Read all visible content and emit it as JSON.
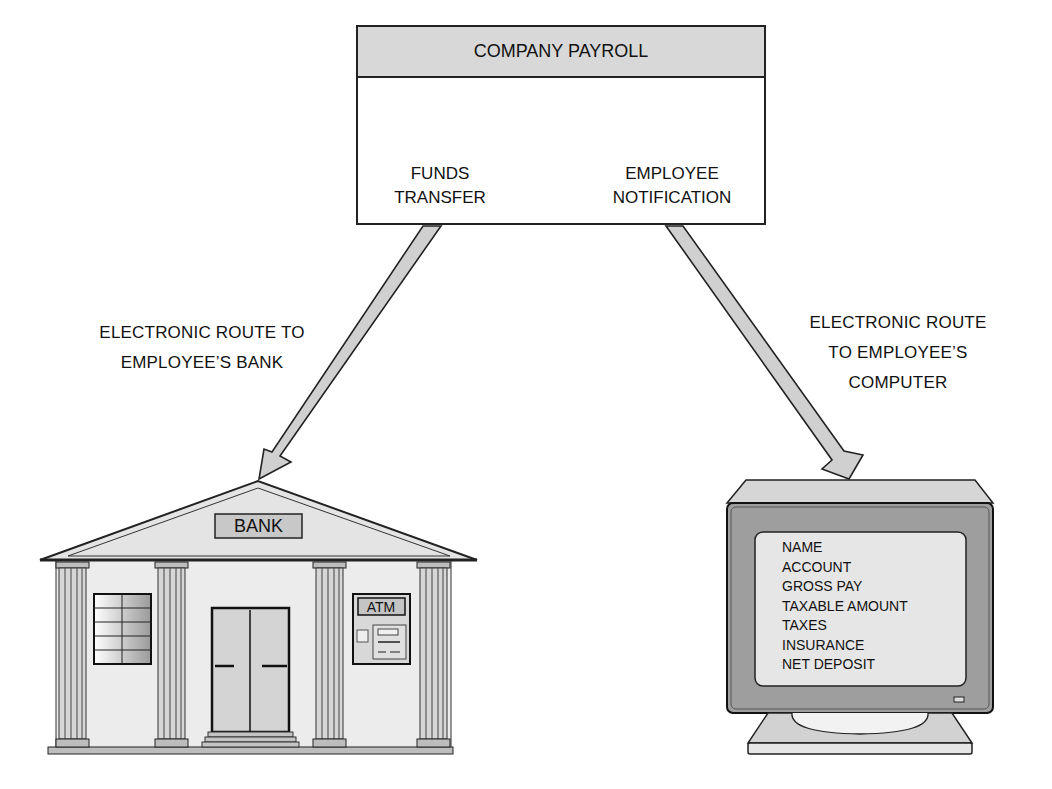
{
  "diagram": {
    "payroll_box": {
      "title": "COMPANY PAYROLL",
      "outputs": [
        {
          "line1": "FUNDS",
          "line2": "TRANSFER"
        },
        {
          "line1": "EMPLOYEE",
          "line2": "NOTIFICATION"
        }
      ]
    },
    "routes": [
      {
        "line1": "ELECTRONIC ROUTE TO",
        "line2": "EMPLOYEE’S BANK"
      },
      {
        "line1": "ELECTRONIC ROUTE",
        "line2": "TO EMPLOYEE’S",
        "line3": "COMPUTER"
      }
    ],
    "bank": {
      "sign": "BANK",
      "atm_label": "ATM"
    },
    "computer": {
      "screen_items": [
        "NAME",
        "ACCOUNT",
        "GROSS PAY",
        "TAXABLE AMOUNT",
        "TAXES",
        "INSURANCE",
        "NET DEPOSIT"
      ]
    },
    "colors": {
      "line": "#222222",
      "fill_light": "#d8d8d8",
      "fill_mid": "#bdbdbd",
      "fill_dark": "#9a9a9a",
      "background": "#ffffff"
    }
  }
}
